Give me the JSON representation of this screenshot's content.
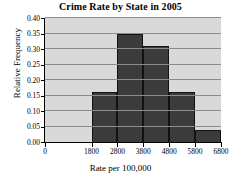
{
  "chart_data": {
    "type": "bar",
    "title": "Crime Rate by State in 2005",
    "xlabel": "Rate per 100,000",
    "ylabel": "Relative Frequency",
    "grid": "horizontal",
    "legend": "none",
    "xlim": [
      0,
      6800
    ],
    "ylim": [
      0.0,
      0.4
    ],
    "bin_edges": [
      1800,
      2800,
      3800,
      4800,
      5800,
      6800
    ],
    "categories": [
      "1800-2800",
      "2800-3800",
      "3800-4800",
      "4800-5800",
      "5800-6800"
    ],
    "values": [
      0.16,
      0.35,
      0.31,
      0.16,
      0.04
    ],
    "ytick_labels": [
      "0.00",
      "0.05",
      "0.10",
      "0.15",
      "0.20",
      "0.25",
      "0.30",
      "0.35",
      "0.40"
    ],
    "ytick_values": [
      0.0,
      0.05,
      0.1,
      0.15,
      0.2,
      0.25,
      0.3,
      0.35,
      0.4
    ],
    "xtick_labels": [
      "0",
      "1800",
      "2800",
      "3800",
      "4800",
      "5800",
      "6800"
    ],
    "xtick_values": [
      0,
      1800,
      2800,
      3800,
      4800,
      5800,
      6800
    ],
    "bar_color": "#3b3b3b",
    "plot_background": "#d9d9d9",
    "grid_color": "#8c8c8c"
  }
}
